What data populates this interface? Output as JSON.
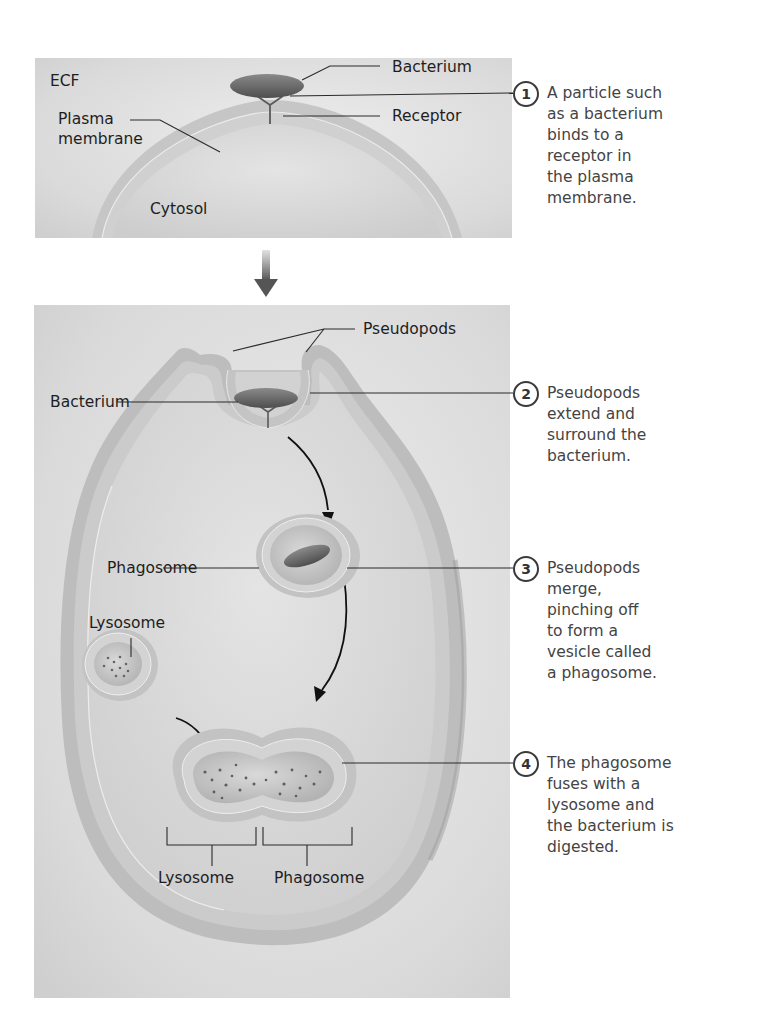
{
  "figure": {
    "arrow_between_panels": "down-arrow"
  },
  "panel1": {
    "labels": {
      "ecf": "ECF",
      "plasma_membrane_line1": "Plasma",
      "plasma_membrane_line2": "membrane",
      "bacterium": "Bacterium",
      "receptor": "Receptor",
      "cytosol": "Cytosol"
    }
  },
  "panel2": {
    "labels": {
      "pseudopods": "Pseudopods",
      "bacterium": "Bacterium",
      "phagosome": "Phagosome",
      "lysosome": "Lysosome",
      "bottom_lysosome": "Lysosome",
      "bottom_phagosome": "Phagosome"
    }
  },
  "steps": [
    {
      "number": "1",
      "lines": [
        "A particle such",
        "as a bacterium",
        "binds to a",
        "receptor in",
        "the plasma",
        "membrane."
      ]
    },
    {
      "number": "2",
      "lines": [
        "Pseudopods",
        "extend and",
        "surround the",
        "bacterium."
      ]
    },
    {
      "number": "3",
      "lines": [
        "Pseudopods",
        "merge,",
        "pinching off",
        "to form a",
        "vesicle called",
        "a phagosome."
      ]
    },
    {
      "number": "4",
      "lines": [
        "The phagosome",
        "fuses with a",
        "lysosome and",
        "the bacterium is",
        "digested."
      ]
    }
  ],
  "colors": {
    "panel_bg": "#dcdcdc",
    "membrane": "#b8b8b8",
    "cytosol": "#d6d6d6",
    "bacterium": "#6e6e6e",
    "leader_line": "#2a2a2a",
    "step_text": "#444444"
  }
}
